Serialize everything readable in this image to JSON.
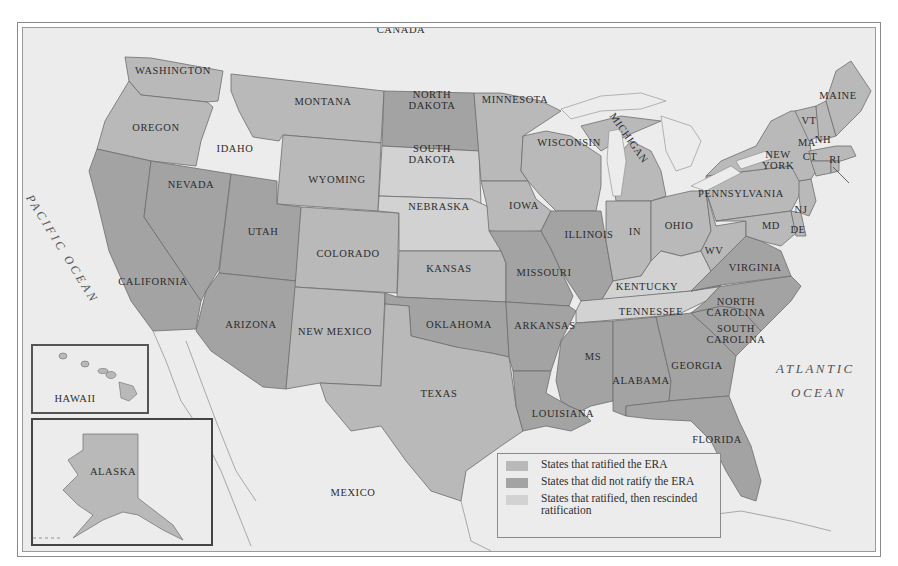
{
  "map": {
    "title": "ERA ratification by state",
    "colors": {
      "water": "#ececec",
      "ratified": "#b9b9b9",
      "not_ratified": "#a3a3a3",
      "rescinded": "#d2d2d2",
      "border": "#6d6d6d"
    },
    "countries": {
      "canada": "CANADA",
      "mexico": "MEXICO"
    },
    "oceans": {
      "pacific": "PACIFIC OCEAN",
      "atlantic_1": "ATLANTIC",
      "atlantic_2": "OCEAN"
    },
    "insets": {
      "hawaii": "HAWAII",
      "alaska": "ALASKA"
    },
    "states": {
      "washington": "WASHINGTON",
      "oregon": "OREGON",
      "california": "CALIFORNIA",
      "idaho": "IDAHO",
      "nevada": "NEVADA",
      "montana": "MONTANA",
      "wyoming": "WYOMING",
      "utah": "UTAH",
      "arizona": "ARIZONA",
      "colorado": "COLORADO",
      "new_mexico": "NEW MEXICO",
      "north_dakota_1": "NORTH",
      "north_dakota_2": "DAKOTA",
      "south_dakota_1": "SOUTH",
      "south_dakota_2": "DAKOTA",
      "nebraska": "NEBRASKA",
      "kansas": "KANSAS",
      "oklahoma": "OKLAHOMA",
      "texas": "TEXAS",
      "minnesota": "MINNESOTA",
      "iowa": "IOWA",
      "missouri": "MISSOURI",
      "arkansas": "ARKANSAS",
      "louisiana": "LOUISIANA",
      "wisconsin": "WISCONSIN",
      "illinois": "ILLINOIS",
      "michigan": "MICHIGAN",
      "indiana": "IN",
      "ohio": "OHIO",
      "kentucky": "KENTUCKY",
      "tennessee": "TENNESSEE",
      "mississippi": "MS",
      "alabama": "ALABAMA",
      "georgia": "GEORGIA",
      "florida": "FLORIDA",
      "south_carolina_1": "SOUTH",
      "south_carolina_2": "CAROLINA",
      "north_carolina_1": "NORTH",
      "north_carolina_2": "CAROLINA",
      "virginia": "VIRGINIA",
      "west_virginia": "WV",
      "maryland": "MD",
      "delaware": "DE",
      "new_jersey": "NJ",
      "pennsylvania": "PENNSYLVANIA",
      "new_york_1": "NEW",
      "new_york_2": "YORK",
      "connecticut": "CT",
      "rhode_island": "RI",
      "massachusetts": "MA",
      "vermont": "VT",
      "new_hampshire": "NH",
      "maine": "MAINE"
    }
  },
  "legend": {
    "items": [
      {
        "label": "States that ratified the ERA",
        "color": "#b9b9b9"
      },
      {
        "label": "States that did not ratify the ERA",
        "color": "#a3a3a3"
      },
      {
        "label": "States that ratified, then rescinded ratification",
        "color": "#d2d2d2"
      }
    ]
  }
}
